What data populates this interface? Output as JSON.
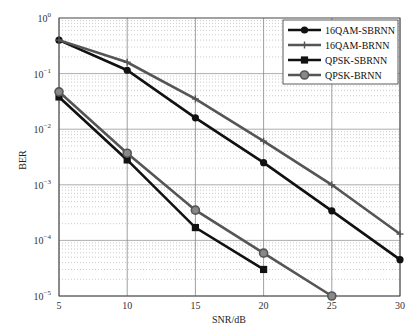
{
  "chart_data": {
    "type": "line",
    "title": "",
    "xlabel": "SNR/dB",
    "ylabel": "BER",
    "yscale": "log",
    "xlim": [
      5,
      30
    ],
    "ylim": [
      1e-05,
      1
    ],
    "x_ticks": [
      "5",
      "10",
      "15",
      "20",
      "25",
      "30"
    ],
    "y_ticks": [
      "10^0",
      "10^-1",
      "10^-2",
      "10^-3",
      "10^-4",
      "10^-5"
    ],
    "grid": true,
    "legend_position": "upper right",
    "series": [
      {
        "name": "16QAM-SBRNN",
        "color": "#111111",
        "marker": "circle",
        "x": [
          5,
          10,
          15,
          20,
          25,
          30
        ],
        "values": [
          0.4,
          0.115,
          0.016,
          0.0025,
          0.00034,
          4.5e-05
        ]
      },
      {
        "name": "16QAM-BRNN",
        "color": "#555555",
        "marker": "plus",
        "x": [
          5,
          10,
          15,
          20,
          25,
          30
        ],
        "values": [
          0.4,
          0.16,
          0.035,
          0.0061,
          0.001,
          0.00013
        ]
      },
      {
        "name": "QPSK-SBRNN",
        "color": "#111111",
        "marker": "square",
        "x": [
          5,
          10,
          15,
          20
        ],
        "values": [
          0.038,
          0.0028,
          0.00017,
          3e-05
        ]
      },
      {
        "name": "QPSK-BRNN",
        "color": "#555555",
        "marker": "circle-open",
        "x": [
          5,
          10,
          15,
          20,
          25
        ],
        "values": [
          0.047,
          0.0037,
          0.00035,
          5.9e-05,
          1e-05
        ]
      }
    ]
  }
}
